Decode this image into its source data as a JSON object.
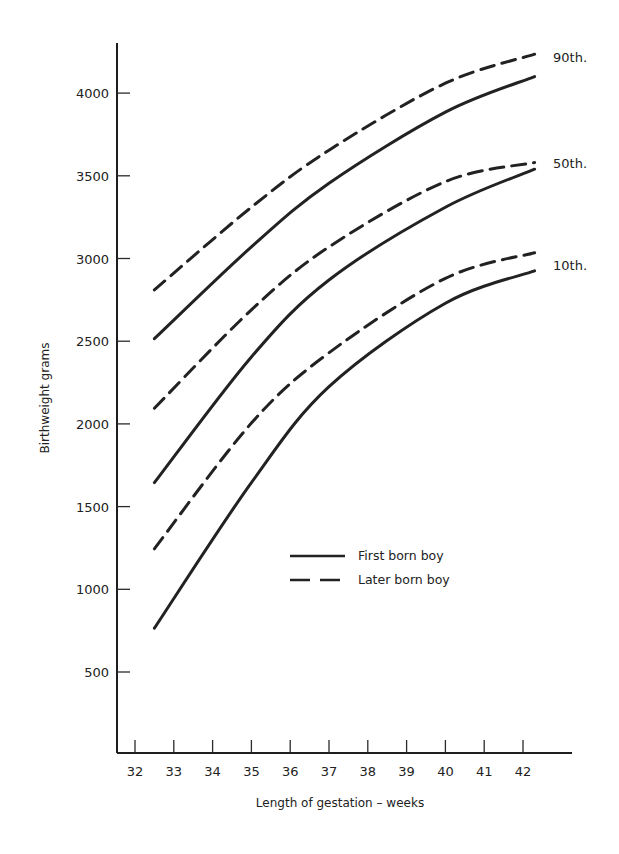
{
  "chart_data": {
    "type": "line",
    "title": "",
    "xlabel": "Length of gestation – weeks",
    "ylabel": "Birthweight  grams",
    "xlim": [
      31.6,
      43.5
    ],
    "ylim": [
      0,
      4300
    ],
    "grid": false,
    "x_ticks": [
      32,
      33,
      34,
      35,
      36,
      37,
      38,
      39,
      40,
      41,
      42
    ],
    "y_ticks": [
      500,
      1000,
      1500,
      2000,
      2500,
      3000,
      3500,
      4000
    ],
    "legend": {
      "position": "inside-lower-right",
      "entries": [
        {
          "label": "First born boy",
          "style": "solid"
        },
        {
          "label": "Later born boy",
          "style": "dashed"
        }
      ]
    },
    "annotations": [
      {
        "text": "90th.",
        "attached_to": "90th percentile curves"
      },
      {
        "text": "50th.",
        "attached_to": "50th percentile curves"
      },
      {
        "text": "10th.",
        "attached_to": "10th percentile curves"
      }
    ],
    "x": [
      32.5,
      35,
      37,
      40,
      42.3
    ],
    "series": [
      {
        "name": "90th percentile - Later born boy",
        "percentile": "90th.",
        "style": "dashed",
        "values": [
          2810,
          3310,
          3655,
          4060,
          4235
        ]
      },
      {
        "name": "90th percentile - First born boy",
        "percentile": "90th.",
        "style": "solid",
        "values": [
          2515,
          3070,
          3455,
          3885,
          4100
        ]
      },
      {
        "name": "50th percentile - Later born boy",
        "percentile": "50th.",
        "style": "dashed",
        "values": [
          2095,
          2690,
          3070,
          3465,
          3580
        ]
      },
      {
        "name": "50th percentile - First born boy",
        "percentile": "50th.",
        "style": "solid",
        "values": [
          1645,
          2405,
          2870,
          3310,
          3540
        ]
      },
      {
        "name": "10th percentile - Later born boy",
        "percentile": "10th.",
        "style": "dashed",
        "values": [
          1245,
          2005,
          2430,
          2880,
          3035
        ]
      },
      {
        "name": "10th percentile - First born boy",
        "percentile": "10th.",
        "style": "solid",
        "values": [
          765,
          1645,
          2225,
          2730,
          2925
        ]
      }
    ]
  }
}
